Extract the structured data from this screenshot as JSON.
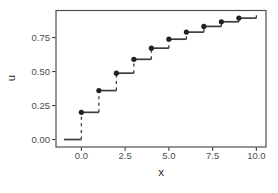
{
  "figure": {
    "width": 278,
    "height": 193,
    "background": "#ffffff",
    "colors": {
      "panel_border": "#4f4f4f",
      "tick": "#333333",
      "tick_label": "#4d4d4d",
      "axis_title": "#1a1a1a",
      "point": "#212121",
      "step_line": "#3d3d3d",
      "riser_line": "#3d3d3d"
    }
  },
  "chart_data": {
    "type": "step",
    "title": "",
    "xlabel": "x",
    "ylabel": "u",
    "x": [
      0,
      1,
      2,
      3,
      4,
      5,
      6,
      7,
      8,
      9
    ],
    "u": [
      0.2,
      0.36,
      0.488,
      0.59,
      0.672,
      0.738,
      0.79,
      0.832,
      0.866,
      0.893
    ],
    "pre_step": {
      "x_start": -1,
      "x_end": 0,
      "u": 0
    },
    "riser_top_at_xmax": {
      "x": 10,
      "u": 0.914
    },
    "x_tick_values": [
      0,
      2.5,
      5,
      7.5,
      10
    ],
    "x_tick_labels": [
      "0.0",
      "2.5",
      "5.0",
      "7.5",
      "10.0"
    ],
    "y_tick_values": [
      0,
      0.25,
      0.5,
      0.75
    ],
    "y_tick_labels": [
      "0.00",
      "0.25",
      "0.50",
      "0.75"
    ],
    "xlim": [
      -1.45,
      10.55
    ],
    "ylim": [
      -0.055,
      0.949
    ],
    "grid": false,
    "legend": null,
    "line_style": {
      "horizontal": "solid",
      "vertical_risers": "dashed"
    },
    "marker": "filled-circle"
  }
}
